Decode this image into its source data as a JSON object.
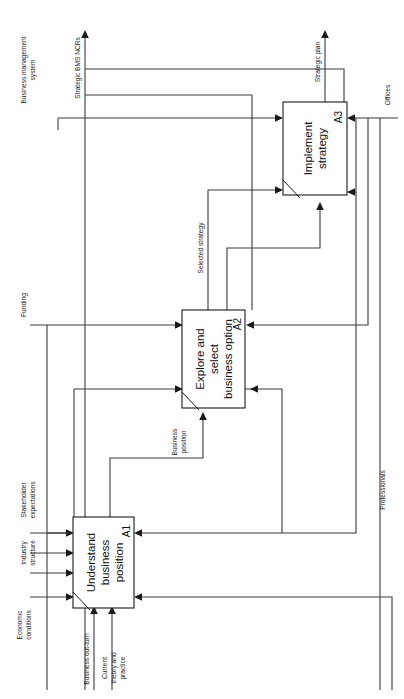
{
  "diagram": {
    "type": "IDEF0 process model",
    "orientation": "rotated-90-clockwise",
    "boxes": [
      {
        "id": "A1",
        "title_line_1": "Understand",
        "title_line_2": "business",
        "title_line_3": "position"
      },
      {
        "id": "A2",
        "title_line_1": "Explore and",
        "title_line_2": "select",
        "title_line_3": "business option"
      },
      {
        "id": "A3",
        "title_line_1": "Implement",
        "title_line_2": "strategy"
      }
    ],
    "labels": {
      "business_management_system": "Business management\nsystem",
      "business_management_system_l1": "Business management",
      "business_management_system_l2": "system",
      "strategic_bms_ncrs": "Strategic BMS NCRs",
      "strategic_plan": "Strategic plan",
      "offices": "Offices",
      "selected_strategy": "Selected strategy",
      "funding": "Funding",
      "business_position_l1": "Business",
      "business_position_l2": "position",
      "stakeholder_expectations_l1": "Stakeholder",
      "stakeholder_expectations_l2": "expectations",
      "industry_structure_l1": "Industry",
      "industry_structure_l2": "structure",
      "professionals": "Professionals",
      "economic_conditions_l1": "Economic",
      "economic_conditions_l2": "conditions",
      "business_out_turn": "Business out-turn",
      "current_theory_l1": "Current",
      "current_theory_l2": "theory and",
      "current_theory_l3": "practice"
    },
    "colors": {
      "line": "#3a3a3a",
      "box_stroke": "#1a1a1a",
      "text": "#111111",
      "background": "#ffffff"
    }
  }
}
